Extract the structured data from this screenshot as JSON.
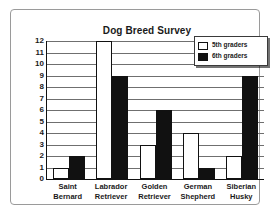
{
  "chart_data": {
    "type": "bar",
    "title": "Dog Breed Survey",
    "xlabel": "",
    "ylabel": "",
    "ylim": [
      0,
      12
    ],
    "yticks": [
      0,
      1,
      2,
      3,
      4,
      5,
      6,
      7,
      8,
      9,
      10,
      11,
      12
    ],
    "grid": true,
    "legend_position": "top-right",
    "categories": [
      "Saint Bernard",
      "Labrador Retriever",
      "Golden Retriever",
      "German Shepherd",
      "Siberian Husky"
    ],
    "category_lines": [
      [
        "Saint",
        "Bernard"
      ],
      [
        "Labrador",
        "Retriever"
      ],
      [
        "Golden",
        "Retriever"
      ],
      [
        "German",
        "Shepherd"
      ],
      [
        "Siberian",
        "Husky"
      ]
    ],
    "series": [
      {
        "name": "5th graders",
        "color": "#ffffff",
        "values": [
          1,
          12,
          3,
          4,
          2
        ]
      },
      {
        "name": "6th graders",
        "color": "#111111",
        "values": [
          2,
          9,
          6,
          1,
          9
        ]
      }
    ]
  },
  "legend": {
    "items": [
      {
        "label": "5th graders",
        "swatch": "white-square-icon"
      },
      {
        "label": "6th graders",
        "swatch": "black-square-icon"
      }
    ]
  },
  "axis": {
    "y_tick_labels": [
      "12",
      "11",
      "10",
      "9",
      "8",
      "7",
      "6",
      "5",
      "4",
      "3",
      "2",
      "1",
      "0"
    ]
  }
}
